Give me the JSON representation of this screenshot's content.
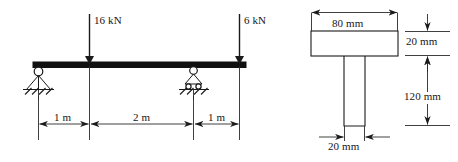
{
  "figure": {
    "line_color": "#1a1a1a",
    "beam_color": "#111111",
    "background": "#ffffff"
  },
  "beam_diagram": {
    "name": "simply-supported-beam-with-overhang",
    "loads": [
      {
        "id": "load-1",
        "label": "16 kN",
        "magnitude": 16,
        "unit": "kN",
        "direction": "down",
        "position_m": 1
      },
      {
        "id": "load-2",
        "label": "6 kN",
        "magnitude": 6,
        "unit": "kN",
        "direction": "down",
        "position_m": 4
      }
    ],
    "supports": [
      {
        "id": "support-left",
        "type": "pin",
        "position_m": 0
      },
      {
        "id": "support-right",
        "type": "roller",
        "position_m": 3
      }
    ],
    "dimensions": [
      {
        "id": "dim-1",
        "label": "1 m",
        "value": 1,
        "unit": "m"
      },
      {
        "id": "dim-2",
        "label": "2 m",
        "value": 2,
        "unit": "m"
      },
      {
        "id": "dim-3",
        "label": "1 m",
        "value": 1,
        "unit": "m"
      }
    ]
  },
  "cross_section": {
    "name": "t-section",
    "shape": "T",
    "dimensions": [
      {
        "id": "flange-width",
        "label": "80 mm",
        "value": 80,
        "unit": "mm",
        "orientation": "horizontal"
      },
      {
        "id": "flange-thickness",
        "label": "20 mm",
        "value": 20,
        "unit": "mm",
        "orientation": "vertical"
      },
      {
        "id": "web-height",
        "label": "120 mm",
        "value": 120,
        "unit": "mm",
        "orientation": "vertical"
      },
      {
        "id": "web-thickness",
        "label": "20 mm",
        "value": 20,
        "unit": "mm",
        "orientation": "horizontal"
      }
    ]
  }
}
